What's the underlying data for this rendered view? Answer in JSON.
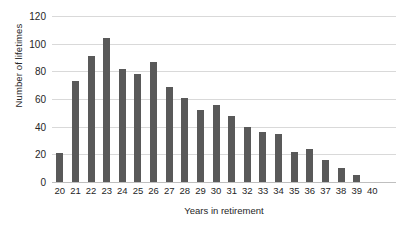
{
  "chart_data": {
    "type": "bar",
    "title": "",
    "subtitle": "",
    "xlabel": "Years in retirement",
    "ylabel": "Number of lifetimes",
    "categories": [
      "20",
      "21",
      "22",
      "23",
      "24",
      "25",
      "26",
      "27",
      "28",
      "29",
      "30",
      "31",
      "32",
      "33",
      "34",
      "35",
      "36",
      "37",
      "38",
      "39",
      "40"
    ],
    "values": [
      21,
      73,
      91,
      104,
      82,
      78,
      87,
      69,
      61,
      52,
      56,
      48,
      40,
      36,
      35,
      22,
      24,
      16,
      10,
      5,
      0
    ],
    "ylim": [
      0,
      120
    ],
    "yticks": [
      0,
      20,
      40,
      60,
      80,
      100,
      120
    ],
    "ytick_labels": [
      "0",
      "20",
      "40",
      "60",
      "80",
      "100",
      "120"
    ],
    "xlim_labels": [
      "20",
      "40"
    ],
    "grid": "horizontal",
    "legend": "none",
    "bar_color": "#595959",
    "gridline_color": "#D9D9D9",
    "text_color": "#262626",
    "background_color": "#FFFFFF"
  }
}
